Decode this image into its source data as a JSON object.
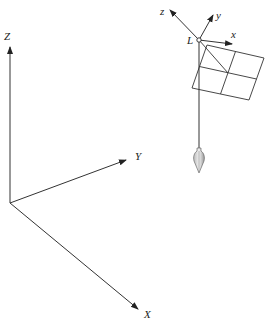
{
  "diagram": {
    "world_axes": {
      "origin": [
        10,
        203
      ],
      "Z": {
        "label": "Z",
        "tip": [
          10,
          46
        ],
        "label_pos": [
          4,
          40
        ]
      },
      "Y": {
        "label": "Y",
        "tip": [
          126,
          160
        ],
        "label_pos": [
          135,
          160
        ]
      },
      "X": {
        "label": "X",
        "tip": [
          138,
          309
        ],
        "label_pos": [
          144,
          318
        ]
      }
    },
    "local_frame": {
      "point_label": "L",
      "point": [
        199,
        40
      ],
      "point_label_pos": [
        187,
        44
      ],
      "z": {
        "label": "z",
        "tip": [
          170,
          9
        ],
        "label_pos": [
          160,
          15
        ]
      },
      "y": {
        "label": "y",
        "tip": [
          213,
          14
        ],
        "label_pos": [
          216,
          19
        ]
      },
      "x": {
        "label": "x",
        "tip": [
          232,
          44
        ],
        "label_pos": [
          231,
          38
        ]
      }
    },
    "grid_plane": {
      "corners": [
        [
          207,
          45
        ],
        [
          264,
          58
        ],
        [
          249,
          100
        ],
        [
          192,
          88
        ]
      ],
      "divisions": "2x2"
    },
    "plumb": {
      "line_top": [
        199,
        40
      ],
      "line_bottom": [
        199,
        148
      ],
      "bob": "plumb-bob"
    }
  }
}
